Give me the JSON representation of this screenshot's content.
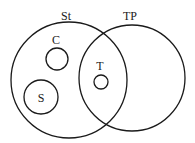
{
  "diagram": {
    "type": "venn",
    "sets": [
      {
        "id": "St",
        "label": "St",
        "cx": 69,
        "cy": 80,
        "r": 58,
        "label_x": 66,
        "label_y": 20
      },
      {
        "id": "TP",
        "label": "TP",
        "cx": 132,
        "cy": 78,
        "r": 53,
        "label_x": 130,
        "label_y": 20
      }
    ],
    "subsets": [
      {
        "id": "C",
        "label": "C",
        "cx": 57,
        "cy": 59,
        "r": 11,
        "label_x": 56,
        "label_y": 44,
        "parent": "St"
      },
      {
        "id": "S",
        "label": "S",
        "cx": 41,
        "cy": 97,
        "r": 17,
        "label_x": 41,
        "label_y": 102,
        "parent": "St"
      },
      {
        "id": "T",
        "label": "T",
        "cx": 101,
        "cy": 82,
        "r": 7,
        "label_x": 100,
        "label_y": 70,
        "parent": "St∩TP"
      }
    ]
  }
}
